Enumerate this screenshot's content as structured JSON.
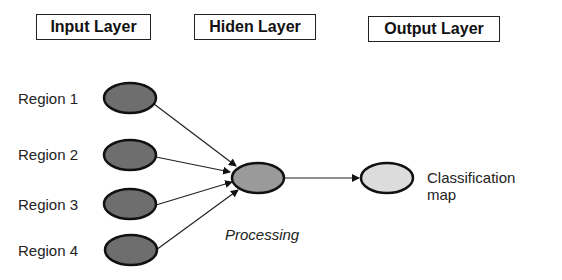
{
  "layers": [
    {
      "label": "Input Layer"
    },
    {
      "label": "Hiden Layer"
    },
    {
      "label": "Output Layer"
    }
  ],
  "input_nodes": [
    {
      "label": "Region 1"
    },
    {
      "label": "Region 2"
    },
    {
      "label": "Region 3"
    },
    {
      "label": "Region 4"
    }
  ],
  "hidden_node": {
    "label": "Processing"
  },
  "output_node": {
    "label_line1": "Classification",
    "label_line2": "map"
  },
  "colors": {
    "input_fill": "#6e6e6e",
    "hidden_fill": "#9a9a9a",
    "output_fill": "#dcdcdc",
    "stroke": "#111111"
  }
}
